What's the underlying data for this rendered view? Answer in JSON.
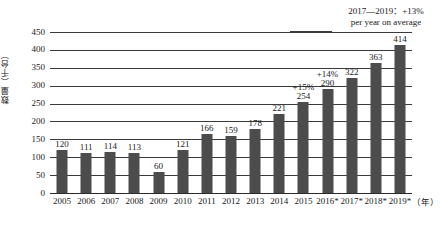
{
  "chart_data": {
    "type": "bar",
    "title": "",
    "subtitle": "",
    "xlabel": "（年）",
    "ylabel": "数量（千台）",
    "ylim": [
      0,
      450
    ],
    "ytick_step": 50,
    "yticks": [
      "0",
      "50",
      "100",
      "150",
      "200",
      "250",
      "300",
      "350",
      "400",
      "450"
    ],
    "grid": true,
    "legend": "none",
    "categories": [
      "2005",
      "2006",
      "2007",
      "2008",
      "2009",
      "2010",
      "2011",
      "2012",
      "2013",
      "2014",
      "2015",
      "2016*",
      "2017*",
      "2018*",
      "2019*"
    ],
    "values": [
      120,
      111,
      114,
      113,
      60,
      121,
      166,
      159,
      178,
      221,
      254,
      290,
      322,
      363,
      414
    ],
    "value_labels": [
      "120",
      "111",
      "114",
      "113",
      "60",
      "121",
      "166",
      "159",
      "178",
      "221",
      "254",
      "290",
      "322",
      "363",
      "414"
    ],
    "growth_labels": [
      "",
      "",
      "",
      "",
      "",
      "",
      "",
      "",
      "",
      "",
      "+15%",
      "+14%",
      "",
      "",
      ""
    ],
    "annotations": [
      {
        "line1": "2017—2019：+13%",
        "line2": "per year on average"
      }
    ],
    "bar_color": "#4c4c4c",
    "grid_color": "#3a3a3a",
    "text_color": "#1a1a1a",
    "background_color": "#ffffff"
  }
}
